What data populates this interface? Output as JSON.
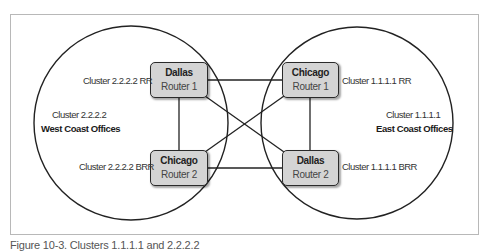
{
  "diagram": {
    "left_cluster": {
      "cluster_label": "Cluster 2.2.2.2",
      "region_label": "West Coast Offices",
      "rr_label": "Cluster 2.2.2.2 RR",
      "brr_label": "Cluster 2.2.2.2 BRR"
    },
    "right_cluster": {
      "cluster_label": "Cluster 1.1.1.1",
      "region_label": "East Coast Offices",
      "rr_label": "Cluster 1.1.1.1 RR",
      "brr_label": "Cluster 1.1.1.1 BRR"
    },
    "routers": [
      {
        "id": "dallas-router-1",
        "name": "Dallas",
        "role": "Router 1"
      },
      {
        "id": "chicago-router-1",
        "name": "Chicago",
        "role": "Router 1"
      },
      {
        "id": "chicago-router-2",
        "name": "Chicago",
        "role": "Router 2"
      },
      {
        "id": "dallas-router-2",
        "name": "Dallas",
        "role": "Router 2"
      }
    ],
    "links": [
      [
        "dallas-router-1",
        "chicago-router-1"
      ],
      [
        "dallas-router-1",
        "chicago-router-2"
      ],
      [
        "dallas-router-1",
        "dallas-router-2"
      ],
      [
        "chicago-router-1",
        "chicago-router-2"
      ],
      [
        "chicago-router-1",
        "dallas-router-2"
      ],
      [
        "chicago-router-2",
        "dallas-router-2"
      ]
    ],
    "colors": {
      "router_fill": "#d4d4d4",
      "stroke": "#222222",
      "frame": "#b8b8b8"
    }
  },
  "caption": "Figure 10-3. Clusters 1.1.1.1 and 2.2.2.2"
}
